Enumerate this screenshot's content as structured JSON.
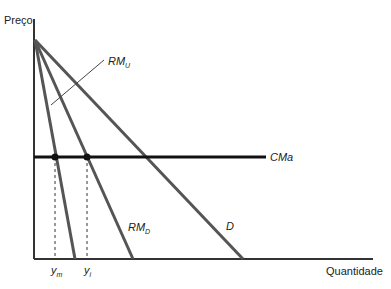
{
  "axes": {
    "y_label": "Preço",
    "x_label": "Quantidade"
  },
  "curves": {
    "rmu": {
      "label": "RM",
      "sub": "U"
    },
    "rmd": {
      "label": "RM",
      "sub": "D"
    },
    "d": {
      "label": "D"
    },
    "cma": {
      "label": "CMa"
    }
  },
  "ticks": {
    "ym": {
      "label": "y",
      "sub": "m"
    },
    "yi": {
      "label": "y",
      "sub": "i"
    }
  },
  "colors": {
    "line": "#555555",
    "axis": "#333333",
    "cma": "#111111"
  }
}
